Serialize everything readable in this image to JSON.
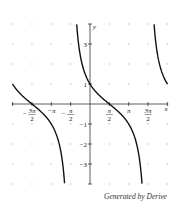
{
  "chart_data": {
    "type": "line",
    "title": "",
    "function": "cot(x/2 + π/4)",
    "xlabel": "x",
    "ylabel": "y",
    "xlim": [
      -6.283,
      6.283
    ],
    "ylim": [
      -4,
      4
    ],
    "grid": "dots",
    "x_ticks": [
      {
        "value": -4.712,
        "label": "-3π/2",
        "num": "3π",
        "den": "2",
        "neg": true
      },
      {
        "value": -3.1416,
        "label": "-π",
        "num": "π",
        "den": "",
        "neg": true
      },
      {
        "value": -1.5708,
        "label": "-π/2",
        "num": "π",
        "den": "2",
        "neg": true
      },
      {
        "value": 1.5708,
        "label": "π/2",
        "num": "π",
        "den": "2",
        "neg": false
      },
      {
        "value": 3.1416,
        "label": "π",
        "num": "π",
        "den": "",
        "neg": false
      },
      {
        "value": 4.712,
        "label": "3π/2",
        "num": "3π",
        "den": "2",
        "neg": false
      }
    ],
    "y_ticks": [
      {
        "value": 3,
        "label": "3"
      },
      {
        "value": 1,
        "label": "1"
      },
      {
        "value": -1,
        "label": "-1"
      },
      {
        "value": -2,
        "label": "-2"
      },
      {
        "value": -3,
        "label": "-3"
      }
    ],
    "series": [
      {
        "name": "branch-left",
        "x_range": [
          -6.283,
          -1.571
        ],
        "points": [
          [
            -6.283,
            1
          ],
          [
            -4.712,
            0
          ],
          [
            -3.604,
            -2
          ],
          [
            -3.1,
            -4
          ]
        ]
      },
      {
        "name": "branch-middle",
        "x_range": [
          -1.08,
          4.65
        ],
        "points": [
          [
            -1.08,
            4
          ],
          [
            0,
            1
          ],
          [
            1.571,
            0
          ],
          [
            3.142,
            -1
          ],
          [
            4.22,
            -4
          ]
        ]
      },
      {
        "name": "branch-right",
        "x_range": [
          5.2,
          6.283
        ],
        "points": [
          [
            5.2,
            4
          ],
          [
            6.283,
            1
          ]
        ]
      }
    ],
    "line_color": "#111111"
  },
  "footer": {
    "text": "Generated by Derive"
  }
}
